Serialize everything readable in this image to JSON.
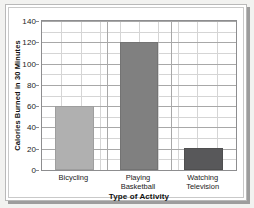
{
  "chart_data": {
    "type": "bar",
    "title": "",
    "xlabel": "Type of Activity",
    "ylabel": "Calories Burned in 30 Minutes",
    "categories": [
      "Bicycling",
      "Playing Basketball",
      "Watching Television"
    ],
    "category_lines": [
      [
        "Bicycling"
      ],
      [
        "Playing",
        "Basketball"
      ],
      [
        "Watching",
        "Television"
      ]
    ],
    "values": [
      60,
      120,
      21
    ],
    "ylim": [
      0,
      140
    ],
    "ytick_step": 20,
    "yticks": [
      0,
      20,
      40,
      60,
      80,
      100,
      120,
      140
    ],
    "ytick_labels": [
      "0",
      "20",
      "40",
      "60",
      "80",
      "100",
      "120",
      "140"
    ],
    "grid": true,
    "grid_minor_step": 10,
    "legend": "none",
    "bar_colors": [
      "#b0b0b0",
      "#808080",
      "#58585a"
    ]
  },
  "axis": {
    "y_title": "Calories Burned in 30 Minutes",
    "x_title": "Type of Activity"
  },
  "style": {
    "page_background": "#f2f2f0",
    "card_background": "#ffffff",
    "shadow_color": "#9d9d9d",
    "frame_border": "#c9c9c9",
    "plot_border": "#8d8d8f",
    "grid_minor_color": "#d5d5d5",
    "grid_major_color": "#a8a8a8",
    "text_color": "#1b1b1b"
  }
}
